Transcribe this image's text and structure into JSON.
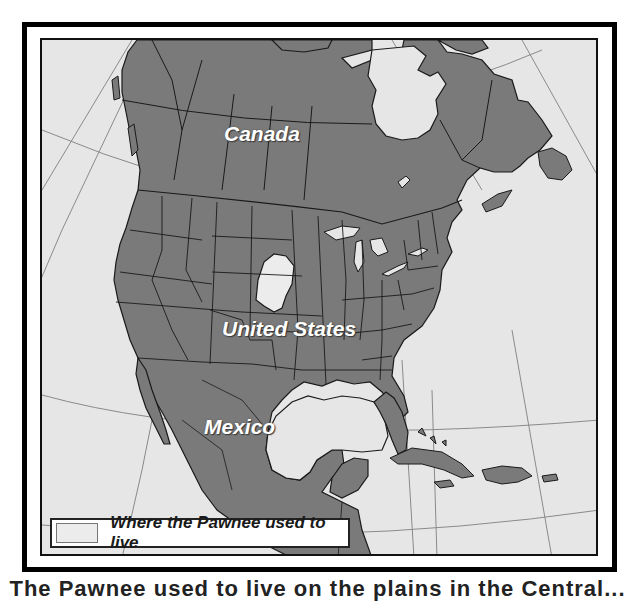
{
  "map": {
    "title": "Pawnee homeland in North America",
    "labels": {
      "canada": "Canada",
      "united_states": "United States",
      "mexico": "Mexico"
    },
    "legend": {
      "swatch_color": "#ececec",
      "text": "Where the Pawnee used to live"
    },
    "colors": {
      "land": "#7a7a7a",
      "water": "#e6e6e6",
      "highlight_region": "#ececec",
      "borders": "#1a1a1a",
      "graticule": "#8a8a8a",
      "frame": "#000000"
    },
    "highlighted_region": "Pawnee territory (Nebraska / northern Kansas)",
    "caption": "The Pawnee used to live on the plains in the Central..."
  }
}
